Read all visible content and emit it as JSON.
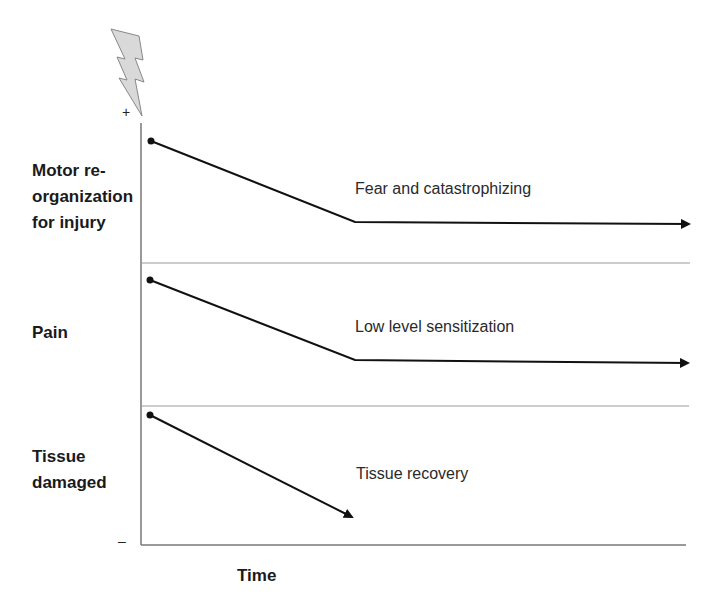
{
  "diagram": {
    "x_axis_label": "Time",
    "y_axis_top_sign": "+",
    "y_axis_bottom_sign": "–",
    "icons": {
      "top": "lightning-bolt-icon"
    },
    "rows": [
      {
        "label": "Motor re-\norganization\nfor injury",
        "curve_label": "Fear and catastrophizing"
      },
      {
        "label": "Pain",
        "curve_label": "Low level sensitization"
      },
      {
        "label": "Tissue\ndamaged",
        "curve_label": "Tissue recovery"
      }
    ]
  },
  "colors": {
    "curve": "#111111",
    "axis": "#777777",
    "divider": "#999999",
    "bolt_fill": "#d9d9d9",
    "bolt_stroke": "#888888"
  }
}
